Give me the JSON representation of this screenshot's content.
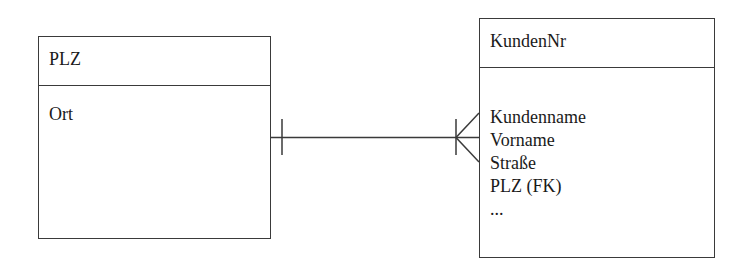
{
  "diagram": {
    "type": "entity-relationship (crow's foot notation)",
    "entities": [
      {
        "id": "plz",
        "key": "PLZ",
        "attributes": [
          "Ort"
        ]
      },
      {
        "id": "kunden",
        "key": "KundenNr",
        "attributes": [
          "Kundenname",
          "Vorname",
          "Straße",
          "PLZ (FK)",
          "..."
        ]
      }
    ],
    "relationships": [
      {
        "from": "plz",
        "to": "kunden",
        "from_cardinality": "one (single bar)",
        "to_cardinality": "one-or-many (bar + crow's foot)"
      }
    ],
    "colors": {
      "line": "#3a3a3a",
      "text": "#1a1a1a",
      "background": "#ffffff"
    }
  }
}
